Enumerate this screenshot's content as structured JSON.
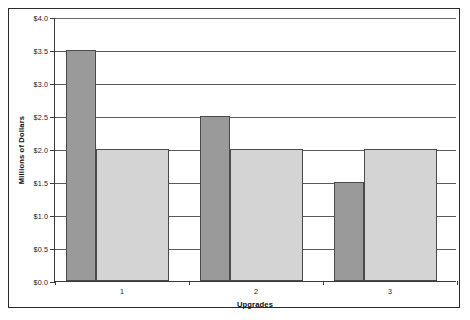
{
  "chart_data": {
    "type": "bar",
    "title": "",
    "xlabel": "Upgrades",
    "ylabel": "Millions of Dollars",
    "categories": [
      "1",
      "2",
      "3"
    ],
    "series": [
      {
        "name": "series-1",
        "color": "#9a9a9a",
        "values": [
          3.5,
          2.5,
          1.5
        ]
      },
      {
        "name": "series-2",
        "color": "#d4d4d4",
        "values": [
          2.0,
          2.0,
          2.0
        ]
      }
    ],
    "ylim": [
      0.0,
      4.0
    ],
    "ytick_step": 0.5,
    "ytick_labels": [
      "$0.0",
      "$0.5",
      "$1.0",
      "$1.5",
      "$2.0",
      "$2.5",
      "$3.0",
      "$3.5",
      "$4.0"
    ],
    "ytick_values": [
      0.0,
      0.5,
      1.0,
      1.5,
      2.0,
      2.5,
      3.0,
      3.5,
      4.0
    ],
    "grid": true,
    "legend": false,
    "legend_position": "none"
  }
}
